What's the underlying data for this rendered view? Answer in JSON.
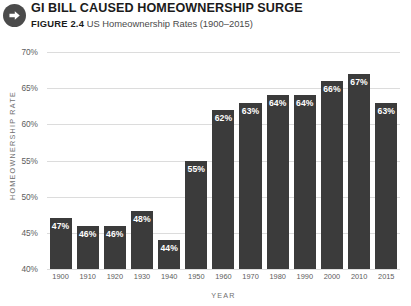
{
  "header": {
    "icon": "arrow-right-circle-icon",
    "title": "GI BILL CAUSED HOMEOWNERSHIP SURGE",
    "figure_label": "FIGURE 2.4",
    "caption": "US Homeownership Rates (1900–2015)"
  },
  "colors": {
    "bar": "#3b3b3b",
    "grid": "#dcdcdc",
    "tick_text": "#5d5d5d",
    "axis_title": "#6f6f6f",
    "value_text": "#ffffff",
    "icon": "#4b4b4b"
  },
  "chart_data": {
    "type": "bar",
    "title": "GI BILL CAUSED HOMEOWNERSHIP SURGE",
    "subtitle": "US Homeownership Rates (1900–2015)",
    "xlabel": "YEAR",
    "ylabel": "HOMEOWNERSHIP RATE",
    "categories": [
      "1900",
      "1910",
      "1920",
      "1930",
      "1940",
      "1950",
      "1960",
      "1970",
      "1980",
      "1990",
      "2000",
      "2010",
      "2015"
    ],
    "values": [
      47,
      46,
      46,
      48,
      44,
      55,
      62,
      63,
      64,
      64,
      66,
      67,
      63
    ],
    "value_labels": [
      "47%",
      "46%",
      "46%",
      "48%",
      "44%",
      "55%",
      "62%",
      "63%",
      "64%",
      "64%",
      "66%",
      "67%",
      "63%"
    ],
    "ylim": [
      40,
      70
    ],
    "yticks": [
      70,
      65,
      60,
      55,
      50,
      45,
      40
    ],
    "ytick_labels": [
      "70%",
      "65%",
      "60%",
      "55%",
      "50%",
      "45%",
      "40%"
    ],
    "grid": true,
    "legend": false
  }
}
